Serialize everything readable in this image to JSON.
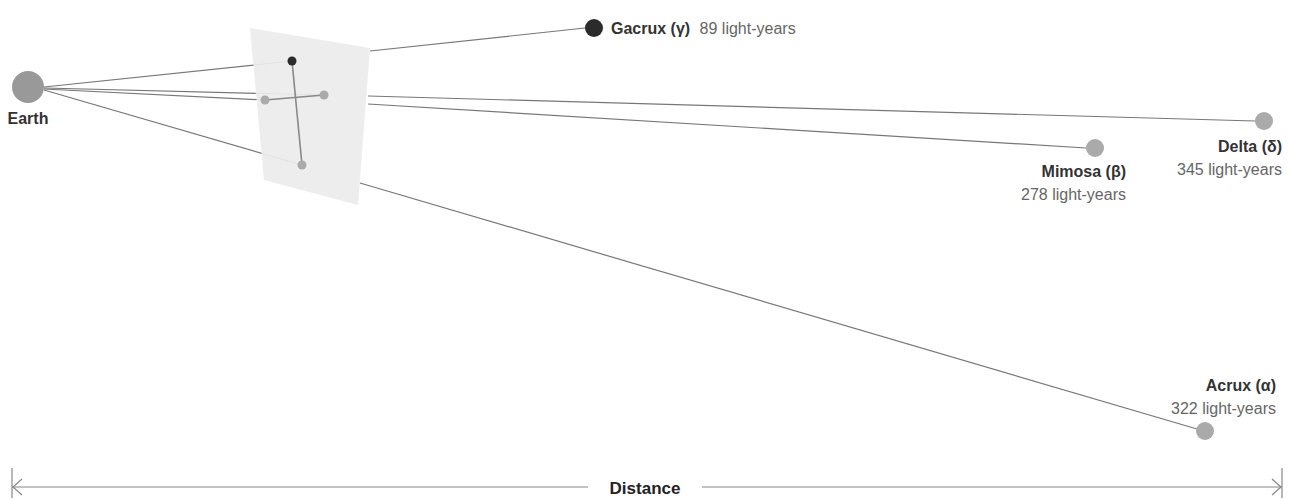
{
  "earth": {
    "label": "Earth",
    "x": 28,
    "y": 87,
    "r": 16,
    "color": "#999999"
  },
  "projection_plane": {
    "points": "250,28 370,48 358,205 264,180",
    "color": "#ececec"
  },
  "projected_points": [
    {
      "id": "gamma",
      "x": 292,
      "y": 61,
      "r": 4.5,
      "color": "#2b2b2b"
    },
    {
      "id": "delta",
      "x": 324,
      "y": 95,
      "r": 4.5,
      "color": "#aaaaaa"
    },
    {
      "id": "beta",
      "x": 265,
      "y": 100,
      "r": 4.5,
      "color": "#aaaaaa"
    },
    {
      "id": "alpha",
      "x": 302,
      "y": 165,
      "r": 4.5,
      "color": "#aaaaaa"
    }
  ],
  "stars": [
    {
      "id": "gamma",
      "name": "Gacrux (γ)",
      "distance": "89 light-years",
      "x": 594,
      "y": 28,
      "r": 9,
      "color": "#2b2b2b"
    },
    {
      "id": "beta",
      "name": "Mimosa (β)",
      "distance": "278 light-years",
      "x": 1095,
      "y": 148,
      "r": 9,
      "color": "#aaaaaa"
    },
    {
      "id": "delta",
      "name": "Delta (δ)",
      "distance": "345 light-years",
      "x": 1264,
      "y": 121,
      "r": 9,
      "color": "#aaaaaa"
    },
    {
      "id": "alpha",
      "name": "Acrux (α)",
      "distance": "322 light-years",
      "x": 1205,
      "y": 431,
      "r": 9,
      "color": "#aaaaaa"
    }
  ],
  "labels": {
    "gamma": {
      "name": "Gacrux (γ)",
      "distance": "89 light-years"
    },
    "beta": {
      "name": "Mimosa (β)",
      "distance": "278 light-years"
    },
    "delta": {
      "name": "Delta (δ)",
      "distance": "345 light-years"
    },
    "alpha": {
      "name": "Acrux (α)",
      "distance": "322 light-years"
    }
  },
  "axis": {
    "label": "Distance",
    "left_x": 12,
    "right_x": 1282,
    "y": 488
  },
  "colors": {
    "line": "#777777",
    "cross_line": "#888888",
    "text_dark": "#333333",
    "text_light": "#666666"
  }
}
